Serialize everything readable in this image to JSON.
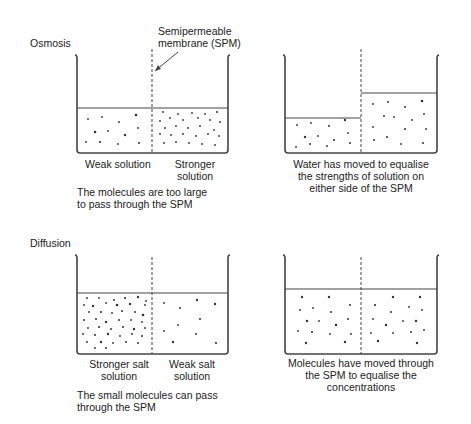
{
  "osmosis": {
    "title": "Osmosis",
    "spm_label_1": "Semipermeable",
    "spm_label_2": "membrane (SPM)",
    "before": {
      "left_label": "Weak solution",
      "right_label_1": "Stronger",
      "right_label_2": "solution",
      "caption_1": "The molecules are too large",
      "caption_2": "to pass through the SPM"
    },
    "after": {
      "caption_1": "Water has moved to equalise",
      "caption_2": "the strengths of solution on",
      "caption_3": "either side of the SPM"
    }
  },
  "diffusion": {
    "title": "Diffusion",
    "before": {
      "left_label_1": "Stronger salt",
      "left_label_2": "solution",
      "right_label_1": "Weak salt",
      "right_label_2": "solution",
      "caption_1": "The small molecules can pass",
      "caption_2": "through the SPM"
    },
    "after": {
      "caption_1": "Molecules have moved through",
      "caption_2": "the SPM to equalise the",
      "caption_3": "concentrations"
    }
  }
}
